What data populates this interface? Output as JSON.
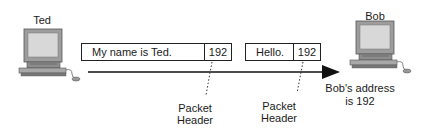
{
  "nodes": {
    "sender": {
      "name": "Ted",
      "icon": "desktop-computer-icon"
    },
    "receiver": {
      "name": "Bob",
      "icon": "desktop-computer-icon",
      "note_line1": "Bob's address",
      "note_line2": "is 192"
    }
  },
  "packets": [
    {
      "payload": "My name is Ted.",
      "header": "192",
      "callout_line1": "Packet",
      "callout_line2": "Header"
    },
    {
      "payload": "Hello.",
      "header": "192",
      "callout_line1": "Packet",
      "callout_line2": "Header"
    }
  ],
  "flow": {
    "direction": "Ted to Bob",
    "arrow": "right-arrow"
  },
  "colors": {
    "stroke": "#222222",
    "screen": "#d4d4d4",
    "body": "#9a9a9a"
  }
}
